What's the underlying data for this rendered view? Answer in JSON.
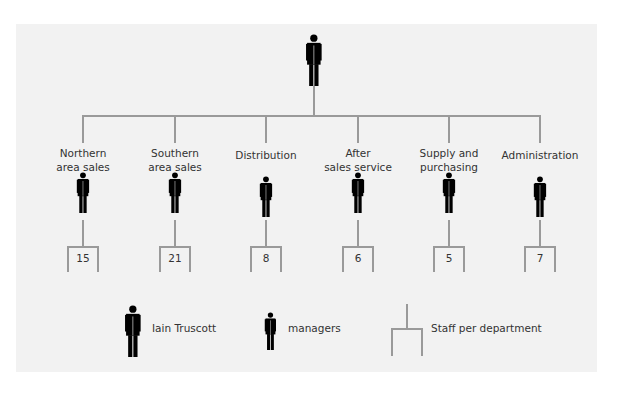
{
  "diagram": {
    "type": "org-chart",
    "top": {
      "role": "Iain Truscott"
    },
    "departments": [
      {
        "label_lines": [
          "Northern",
          "area sales"
        ],
        "staff": "15"
      },
      {
        "label_lines": [
          "Southern",
          "area sales"
        ],
        "staff": "21"
      },
      {
        "label_lines": [
          "Distribution"
        ],
        "staff": "8"
      },
      {
        "label_lines": [
          "After",
          "sales service"
        ],
        "staff": "6"
      },
      {
        "label_lines": [
          "Supply and",
          "purchasing"
        ],
        "staff": "5"
      },
      {
        "label_lines": [
          "Administration"
        ],
        "staff": "7"
      }
    ],
    "legend": {
      "top_figure": "Iain Truscott",
      "manager_figure": "managers",
      "bracket": "Staff per department"
    },
    "colors": {
      "panel": "#f2f2f2",
      "lines": "#9a9a9a",
      "figures": "#000000"
    }
  }
}
